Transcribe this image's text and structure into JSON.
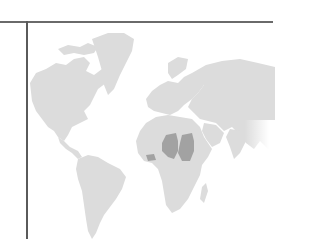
{
  "map": {
    "type": "world-choropleth",
    "base_land_color": "#dcdcdc",
    "highlight_color": "#a2a2a2",
    "highlighted_regions": [
      {
        "name": "Chad",
        "label": "Chad"
      },
      {
        "name": "Sudan",
        "label": "Sudan"
      },
      {
        "name": "West Africa coastal country",
        "label": "Ghana/Togo/Benin region"
      }
    ],
    "visible_continents": [
      "North America",
      "Greenland",
      "South America",
      "Europe",
      "Africa",
      "Asia"
    ]
  }
}
